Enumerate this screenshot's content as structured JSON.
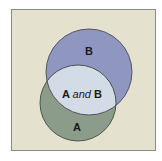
{
  "diagram": {
    "type": "venn",
    "universe": {
      "fill": "#e4e2cf",
      "stroke": "#8a8a86"
    },
    "sets": [
      {
        "id": "B",
        "label": "B",
        "fill": "#8f97c0",
        "stroke": "#4a4a55"
      },
      {
        "id": "A",
        "label": "A",
        "fill": "#8b9c8a",
        "stroke": "#3e4a3e"
      }
    ],
    "intersection": {
      "label_a": "A",
      "label_and": "and",
      "label_b": "B",
      "fill": "#d3dbe6"
    }
  }
}
